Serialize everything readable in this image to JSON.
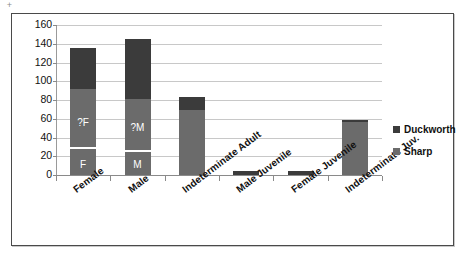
{
  "artifact": {
    "glyph": "+"
  },
  "chart_data": {
    "type": "bar",
    "stacked": true,
    "title": "",
    "subtitle": "",
    "xlabel": "",
    "ylabel": "",
    "ylim": [
      0,
      160
    ],
    "ytick_step": 20,
    "ytick_labels": [
      "160",
      "140",
      "120",
      "100",
      "80",
      "60",
      "40",
      "20",
      "0"
    ],
    "grid": true,
    "legend_position": "right",
    "categories": [
      "Female",
      "Male",
      "Indeterminate Adult",
      "Male Juvenile",
      "Female Juvenile",
      "Indeterminate Juv."
    ],
    "series": [
      {
        "name": "Sharp",
        "color": "#6b6b6b",
        "values": [
          92,
          81,
          69,
          0,
          0,
          57
        ]
      },
      {
        "name": "Duckworth",
        "color": "#3b3b3b",
        "values": [
          43,
          64,
          14,
          4,
          4,
          2
        ]
      }
    ],
    "totals": [
      135,
      145,
      83,
      4,
      4,
      59
    ],
    "bar_annotations": [
      {
        "category": "Female",
        "labels": [
          "?F",
          "F"
        ]
      },
      {
        "category": "Male",
        "labels": [
          "?M",
          "M"
        ]
      }
    ]
  },
  "legend": {
    "entries": [
      {
        "label": "Duckworth",
        "color": "#3b3b3b"
      },
      {
        "label": "Sharp",
        "color": "#6b6b6b"
      }
    ]
  }
}
